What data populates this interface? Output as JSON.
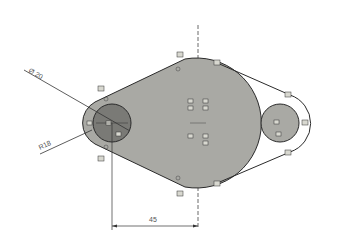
{
  "diagram": {
    "type": "cad-sketch",
    "colors": {
      "background": "#ffffff",
      "body_fill": "#a9a9a4",
      "small_hole_fill": "#7a7a76",
      "right_boss_fill": "#a9a9a4",
      "outline": "#2a2a2a",
      "centerline": "#444444"
    },
    "dimensions": {
      "diameter_label": "Ø 20",
      "radius_label": "R18",
      "horizontal_label": "45"
    },
    "constraint_tags": {
      "top_left": "p4",
      "top_center": "p4",
      "top_right": "p4",
      "left_upper": "p4",
      "left_lower": "p4",
      "bottom_center": "p4",
      "bottom_right": "p4",
      "right_upper": "p4",
      "right_lower": "p4",
      "right_end": "p4",
      "center_1": "p4",
      "center_2": "p4",
      "center_3": "p4",
      "center_4": "p4",
      "center_5": "p4",
      "center_6": "p4",
      "center_7": "p4",
      "center_8": "p4",
      "small_circle_left": "p4",
      "small_circle_center": "p4",
      "small_circle_lower": "p4",
      "right_circle_center": "p4",
      "right_circle_lower": "p4"
    }
  }
}
